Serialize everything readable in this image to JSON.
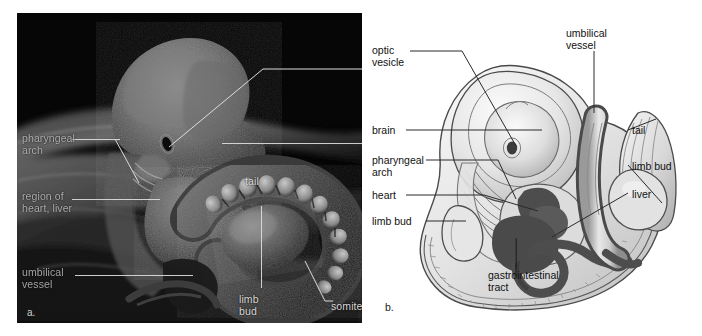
{
  "figure": {
    "type": "two-panel biology figure: embryo SEM micrograph and labeled illustration"
  },
  "panel_a": {
    "tag": "a.",
    "caption_kind": "scanning electron micrograph of embryo",
    "labels": [
      {
        "name": "pharyngeal-arch",
        "text": "pharyngeal\narch",
        "x": 5,
        "y": 120,
        "align": "left"
      },
      {
        "name": "region-heart-liver",
        "text": "region of\nheart, liver",
        "x": 5,
        "y": 178,
        "align": "left"
      },
      {
        "name": "umbilical-vessel",
        "text": "umbilical\nvessel",
        "x": 5,
        "y": 254,
        "align": "left"
      },
      {
        "name": "tail",
        "text": "tail",
        "x": 228,
        "y": 163,
        "align": "left"
      },
      {
        "name": "limb-bud",
        "text": "limb\nbud",
        "x": 222,
        "y": 281,
        "align": "left"
      },
      {
        "name": "somite",
        "text": "somite",
        "x": 312,
        "y": 292,
        "align": "left"
      }
    ]
  },
  "panel_b": {
    "tag": "b.",
    "caption_kind": "illustration of the same embryo, labeled",
    "labels_left": [
      {
        "name": "optic-vesicle",
        "text": "optic\nvesicle",
        "x": 6,
        "y": 32
      },
      {
        "name": "brain",
        "text": "brain",
        "x": 6,
        "y": 112
      },
      {
        "name": "pharyngeal-arch",
        "text": "pharyngeal\narch",
        "x": 6,
        "y": 142
      },
      {
        "name": "heart",
        "text": "heart",
        "x": 6,
        "y": 177
      },
      {
        "name": "limb-bud",
        "text": "limb bud",
        "x": 6,
        "y": 203
      }
    ],
    "labels_right": [
      {
        "name": "tail",
        "text": "tail",
        "x": 264,
        "y": 112
      },
      {
        "name": "limb-bud",
        "text": "limb bud",
        "x": 264,
        "y": 148
      },
      {
        "name": "liver",
        "text": "liver",
        "x": 264,
        "y": 176
      }
    ],
    "labels_top": [
      {
        "name": "umbilical-vessel",
        "text": "umbilical\nvessel",
        "x": 180,
        "y": 15
      }
    ],
    "labels_bottom": [
      {
        "name": "gastrointestinal-tract",
        "text": "gastrointestinal\ntract",
        "x": 124,
        "y": 256
      }
    ]
  },
  "colors": {
    "sem_background": "#050505",
    "sem_label_text": "#d8d8d8",
    "sem_leader_line": "#dcdcdc",
    "page_background": "#ffffff",
    "art_outline": "#3a3a3a",
    "art_fill_light": "#e9e9e9",
    "art_fill_mid": "#c8c8c8",
    "art_fill_dark": "#6d6d6d",
    "art_fill_darkest": "#4a4a4a",
    "label_text": "#111111"
  }
}
